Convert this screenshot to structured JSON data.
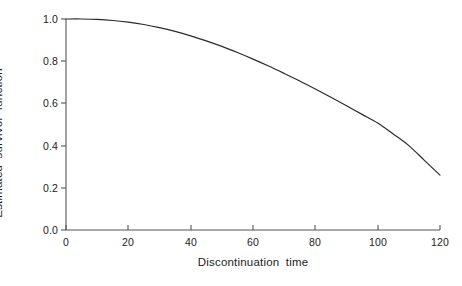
{
  "chart_data": {
    "type": "line",
    "title": "",
    "xlabel": "Discontinuation time",
    "ylabel": "Estimated  survivor  function",
    "xlim": [
      0,
      120
    ],
    "ylim": [
      0.0,
      1.0
    ],
    "xticks": [
      0,
      20,
      40,
      60,
      80,
      100,
      120
    ],
    "xtick_labels": [
      "0",
      "20",
      "40",
      "60",
      "80",
      "100",
      "120"
    ],
    "yticks": [
      0.0,
      0.2,
      0.4,
      0.6,
      0.8,
      1.0
    ],
    "ytick_labels": [
      "0.0",
      "0.2",
      "0.4",
      "0.6",
      "0.8",
      "1.0"
    ],
    "grid": false,
    "legend": null,
    "line_color": "#2b2b2b",
    "line_width": 1.2,
    "series": [
      {
        "name": "Estimated survivor function",
        "x": [
          0,
          5,
          10,
          15,
          20,
          25,
          30,
          35,
          40,
          45,
          50,
          55,
          60,
          65,
          70,
          75,
          80,
          85,
          90,
          95,
          100,
          105,
          110,
          115,
          120
        ],
        "values": [
          1.0,
          1.0,
          0.998,
          0.993,
          0.985,
          0.974,
          0.959,
          0.941,
          0.92,
          0.896,
          0.87,
          0.841,
          0.81,
          0.777,
          0.742,
          0.706,
          0.668,
          0.629,
          0.589,
          0.548,
          0.507,
          0.455,
          0.4,
          0.33,
          0.26
        ]
      }
    ]
  },
  "axes": {
    "x_axis_name": "discontinuation-time-axis",
    "y_axis_name": "estimated-survivor-function-axis"
  }
}
